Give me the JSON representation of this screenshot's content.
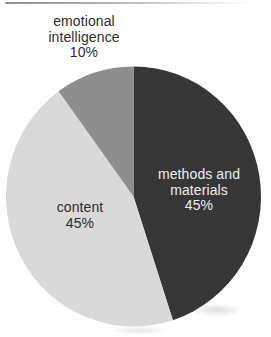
{
  "chart_data": {
    "type": "pie",
    "unit": "percent",
    "start_angle_deg": 0,
    "direction": "clockwise",
    "slices": [
      {
        "id": "methods-and-materials",
        "label": "methods and materials",
        "pct_label": "45%",
        "value": 45,
        "color": "#363636",
        "label_color": "#eeeeee",
        "label_position": "inside"
      },
      {
        "id": "content",
        "label": "content",
        "pct_label": "45%",
        "value": 45,
        "color": "#d9d9d9",
        "label_color": "#2d2d2d",
        "label_position": "inside"
      },
      {
        "id": "emotional-intelligence",
        "label": "emotional intelligence",
        "pct_label": "10%",
        "value": 10,
        "color": "#8e8e8e",
        "label_color": "#2d2d2d",
        "label_position": "outside-top-left"
      }
    ],
    "legend": "none",
    "background": "#ffffff"
  }
}
